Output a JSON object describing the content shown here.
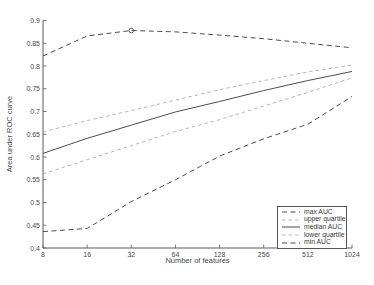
{
  "colors": {
    "background": "#ffffff",
    "axis": "#5a5a5a",
    "text": "#4a4a4a",
    "dark_line": "#4d4d4d",
    "light_line": "#b5b5b5"
  },
  "chart_data": {
    "type": "line",
    "title": "",
    "xlabel": "Number of features",
    "ylabel": "Area under ROC curve",
    "x_scale": "log2",
    "grid": false,
    "legend_position": "inside-bottom-right",
    "xlim": [
      8,
      1024
    ],
    "ylim": [
      0.4,
      0.9
    ],
    "x": [
      8,
      16,
      32,
      64,
      128,
      256,
      512,
      1024
    ],
    "x_tick_labels": [
      "8",
      "16",
      "32",
      "64",
      "128",
      "256",
      "512",
      "1024"
    ],
    "y_ticks": [
      0.4,
      0.45,
      0.5,
      0.55,
      0.6,
      0.65,
      0.7,
      0.75,
      0.8,
      0.85,
      0.9
    ],
    "y_tick_labels": [
      "0.4",
      "0.45",
      "0.5",
      "0.55",
      "0.6",
      "0.65",
      "0.7",
      "0.75",
      "0.8",
      "0.85",
      "0.9"
    ],
    "series": [
      {
        "name": "max AUC",
        "style": "dashed",
        "color": "#4d4d4d",
        "dash": "5 3.5",
        "values": [
          0.822,
          0.866,
          0.878,
          0.875,
          0.868,
          0.86,
          0.85,
          0.84
        ],
        "marker": {
          "x": 32,
          "y": 0.878,
          "shape": "open-circle"
        }
      },
      {
        "name": "upper quartile",
        "style": "dashed",
        "color": "#b5b5b5",
        "dash": "3.5 3",
        "values": [
          0.655,
          0.68,
          0.702,
          0.725,
          0.748,
          0.768,
          0.787,
          0.802
        ]
      },
      {
        "name": "median AUC",
        "style": "solid",
        "color": "#4d4d4d",
        "dash": "",
        "values": [
          0.608,
          0.641,
          0.67,
          0.699,
          0.722,
          0.746,
          0.768,
          0.788
        ]
      },
      {
        "name": "lower quartile",
        "style": "dashed",
        "color": "#b5b5b5",
        "dash": "3.5 3",
        "values": [
          0.563,
          0.594,
          0.625,
          0.656,
          0.682,
          0.712,
          0.742,
          0.774
        ]
      },
      {
        "name": "min AUC",
        "style": "dashed",
        "color": "#4d4d4d",
        "dash": "5 3.5",
        "values": [
          0.436,
          0.443,
          0.502,
          0.55,
          0.602,
          0.64,
          0.672,
          0.733
        ]
      }
    ]
  }
}
